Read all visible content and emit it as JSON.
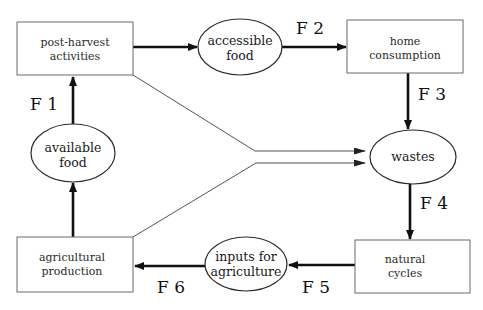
{
  "diagram": {
    "boxes": {
      "post_harvest": {
        "line1": "post-harvest",
        "line2": "activities"
      },
      "home_consumption": {
        "line1": "home",
        "line2": "consumption"
      },
      "agricultural_production": {
        "line1": "agricultural",
        "line2": "production"
      },
      "natural_cycles": {
        "line1": "natural",
        "line2": "cycles"
      }
    },
    "ellipses": {
      "accessible_food": {
        "line1": "accessible",
        "line2": "food"
      },
      "available_food": {
        "line1": "available",
        "line2": "food"
      },
      "wastes": {
        "line1": "wastes"
      },
      "inputs": {
        "line1": "inputs for",
        "line2": "agriculture"
      }
    },
    "flows": {
      "f1": "F 1",
      "f2": "F 2",
      "f3": "F 3",
      "f4": "F 4",
      "f5": "F 5",
      "f6": "F 6"
    }
  }
}
